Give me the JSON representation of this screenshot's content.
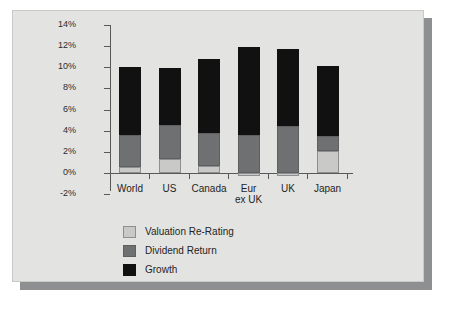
{
  "chart_data": {
    "type": "bar",
    "subtype": "stacked-bar",
    "title": "",
    "xlabel": "",
    "ylabel": "",
    "ylim": [
      -2,
      14
    ],
    "ytick_step": 2,
    "ytick_labels": [
      "14%",
      "12%",
      "10%",
      "8%",
      "6%",
      "4%",
      "2%",
      "0%",
      "-2%"
    ],
    "ytick_values": [
      14,
      12,
      10,
      8,
      6,
      4,
      2,
      0,
      -2
    ],
    "grid": false,
    "legend_position": "bottom-left",
    "categories": [
      "World",
      "US",
      "Canada",
      "Eur ex UK",
      "UK",
      "Japan"
    ],
    "category_lines": [
      [
        "World"
      ],
      [
        "US"
      ],
      [
        "Canada"
      ],
      [
        "Eur",
        "ex UK"
      ],
      [
        "UK"
      ],
      [
        "Japan"
      ]
    ],
    "series": [
      {
        "name": "Valuation Re-Rating",
        "color": "#c9c9c7",
        "values": [
          0.6,
          1.35,
          0.7,
          -0.3,
          -0.3,
          2.1
        ]
      },
      {
        "name": "Dividend Return",
        "color": "#6e7072",
        "values": [
          3.0,
          3.15,
          3.1,
          3.55,
          4.4,
          1.4
        ]
      },
      {
        "name": "Growth",
        "color": "#111111",
        "values": [
          6.4,
          5.4,
          7.0,
          8.4,
          7.35,
          6.65
        ]
      }
    ],
    "totals": [
      10.0,
      9.9,
      10.8,
      11.65,
      11.45,
      10.15
    ]
  },
  "legend": {
    "items": [
      {
        "label": "Valuation Re-Rating",
        "key": "valuation"
      },
      {
        "label": "Dividend Return",
        "key": "dividend"
      },
      {
        "label": "Growth",
        "key": "growth"
      }
    ]
  },
  "colors": {
    "panel_background": "#e3e3e1",
    "page_background": "#ffffff",
    "shadow": "#8d8f91",
    "axis": "#58595b",
    "text": "#1f1f1f"
  }
}
